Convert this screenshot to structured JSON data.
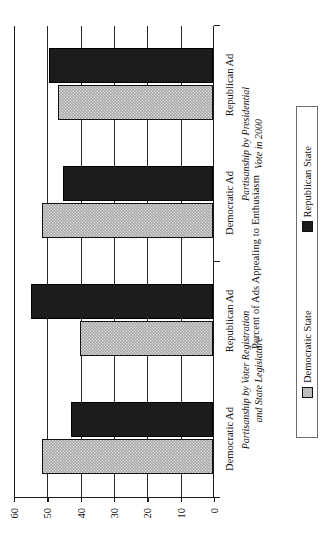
{
  "chart_data": {
    "type": "bar",
    "title": "",
    "orientation": "vertical-grouped",
    "xlabel": "",
    "ylabel": "Percent of Ads Appealing to Enthusiasm",
    "ylim": [
      0,
      60
    ],
    "yticks": [
      0,
      10,
      20,
      30,
      40,
      50,
      60
    ],
    "grid": true,
    "legend_position": "bottom",
    "legend": [
      "Democratic State",
      "Republican State"
    ],
    "categories": [
      "Democratic Ad",
      "Republican Ad",
      "Democratic Ad",
      "Republican Ad"
    ],
    "panels": [
      {
        "label_line1": "Partisanship by Voter Registration",
        "label_line2": "and State Legislature",
        "categories": [
          "Democratic Ad",
          "Republican Ad"
        ]
      },
      {
        "label_line1": "Partisanship by Presidential",
        "label_line2": "Vote in 2000",
        "categories": [
          "Democratic Ad",
          "Republican Ad"
        ]
      }
    ],
    "series": [
      {
        "name": "Democratic State",
        "color": "#a8a8a8",
        "values": [
          51.3,
          40.0,
          51.2,
          46.4
        ]
      },
      {
        "name": "Republican State",
        "color": "#1c1c1c",
        "values": [
          42.5,
          54.7,
          45.1,
          49.1
        ]
      }
    ]
  },
  "axis": {
    "y_title": "Percent of Ads Appealing to Enthusiasm",
    "tick_labels": [
      "0",
      "10",
      "20",
      "30",
      "40",
      "50",
      "60"
    ]
  },
  "legend": {
    "item_democratic": "Democratic State",
    "item_republican": "Republican State"
  },
  "labels": {
    "cat_0": "Democratic Ad",
    "cat_1": "Republican Ad",
    "cat_2": "Democratic Ad",
    "cat_3": "Republican Ad",
    "panel_0_line1": "Partisanship by Voter Registration",
    "panel_0_line2": "and State Legislature",
    "panel_1_line1": "Partisanship by Presidential",
    "panel_1_line2": "Vote in 2000"
  }
}
